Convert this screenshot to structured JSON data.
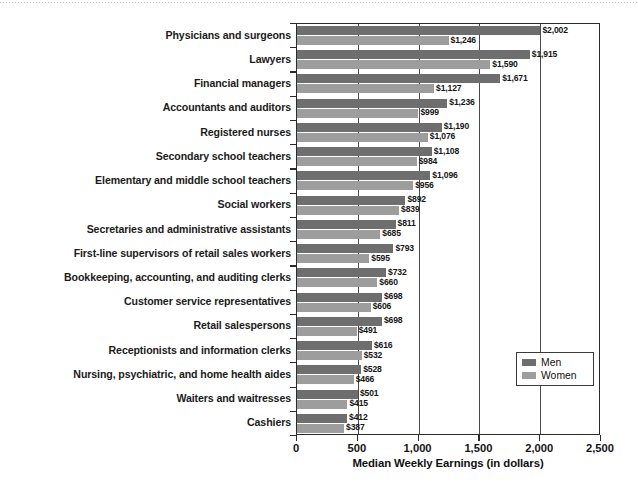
{
  "chart_data": {
    "type": "bar",
    "orientation": "horizontal",
    "title": "",
    "xlabel": "Median Weekly Earnings (in dollars)",
    "ylabel": "",
    "xlim": [
      0,
      2500
    ],
    "xticks": [
      "0",
      "500",
      "1,000",
      "1,500",
      "2,000",
      "2,500"
    ],
    "xtick_values": [
      0,
      500,
      1000,
      1500,
      2000,
      2500
    ],
    "grid": "vertical",
    "legend_position": "bottom-right",
    "categories": [
      "Physicians and surgeons",
      "Lawyers",
      "Financial managers",
      "Accountants and auditors",
      "Registered nurses",
      "Secondary school teachers",
      "Elementary and middle school teachers",
      "Social workers",
      "Secretaries and administrative assistants",
      "First-line supervisors of retail sales workers",
      "Bookkeeping, accounting, and auditing clerks",
      "Customer service representatives",
      "Retail salespersons",
      "Receptionists and information clerks",
      "Nursing, psychiatric, and home health aides",
      "Waiters and waitresses",
      "Cashiers"
    ],
    "series": [
      {
        "name": "Men",
        "color": "#6e6e6e",
        "values": [
          2002,
          1915,
          1671,
          1236,
          1190,
          1108,
          1096,
          892,
          811,
          793,
          732,
          698,
          698,
          616,
          528,
          501,
          412
        ],
        "labels": [
          "$2,002",
          "$1,915",
          "$1,671",
          "$1,236",
          "$1,190",
          "$1,108",
          "$1,096",
          "$892",
          "$811",
          "$793",
          "$732",
          "$698",
          "$698",
          "$616",
          "$528",
          "$501",
          "$412"
        ]
      },
      {
        "name": "Women",
        "color": "#9d9d9d",
        "values": [
          1246,
          1590,
          1127,
          999,
          1076,
          984,
          956,
          839,
          685,
          595,
          660,
          606,
          491,
          532,
          466,
          415,
          387
        ],
        "labels": [
          "$1,246",
          "$1,590",
          "$1,127",
          "$999",
          "$1,076",
          "$984",
          "$956",
          "$839",
          "$685",
          "$595",
          "$660",
          "$606",
          "$491",
          "$532",
          "$466",
          "$415",
          "$387"
        ]
      }
    ]
  },
  "legend": {
    "items": [
      {
        "label": "Men",
        "swatch": "men"
      },
      {
        "label": "Women",
        "swatch": "women"
      }
    ]
  }
}
